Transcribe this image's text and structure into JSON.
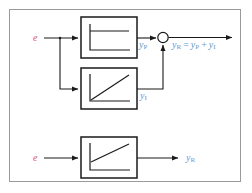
{
  "figure": {
    "border_color": "#9a9a9a",
    "background": "#ffffff",
    "line_color": "#1a1a1a",
    "input_label_color": "#e0527f",
    "signal_label_color": "#5b9bd5"
  },
  "top_section": {
    "input": {
      "label": "e"
    },
    "p_block": {
      "name": "proportional-block",
      "response": "step"
    },
    "i_block": {
      "name": "integral-block",
      "response": "ramp"
    },
    "p_output": {
      "symbol": "y",
      "subscript": "P"
    },
    "i_output": {
      "symbol": "y",
      "subscript": "I"
    },
    "summing_junction": {
      "name": "summing-junction"
    },
    "equation": {
      "lhs_symbol": "y",
      "lhs_subscript": "R",
      "equals": "=",
      "term1_symbol": "y",
      "term1_subscript": "P",
      "plus": "+",
      "term2_symbol": "y",
      "term2_subscript": "I"
    }
  },
  "bottom_section": {
    "input": {
      "label": "e"
    },
    "pi_block": {
      "name": "pi-block",
      "response": "step-plus-ramp"
    },
    "output": {
      "symbol": "y",
      "subscript": "R"
    }
  }
}
